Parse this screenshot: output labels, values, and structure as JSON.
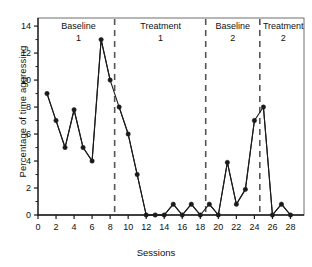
{
  "chart_data": {
    "type": "line",
    "title": "",
    "xlabel": "Sessions",
    "ylabel": "Percentage of time aggressing",
    "xlim": [
      0,
      29.5
    ],
    "ylim": [
      0,
      14.6
    ],
    "xticks": [
      0,
      2,
      4,
      6,
      8,
      10,
      12,
      14,
      16,
      18,
      20,
      22,
      24,
      26,
      28
    ],
    "xtick_labels": [
      "0",
      "2",
      "4",
      "6",
      "8",
      "10",
      "12",
      "14",
      "16",
      "18",
      "20",
      "22",
      "24",
      "26",
      "28"
    ],
    "yticks": [
      0,
      2,
      4,
      6,
      8,
      10,
      12,
      14
    ],
    "ytick_labels": [
      "0",
      "2",
      "4",
      "6",
      "8",
      "10",
      "12",
      "14"
    ],
    "grid": false,
    "legend": "none",
    "marker": "filled-circle",
    "line_color": "#1a1a1a",
    "phase_dividers": [
      8.5,
      18.6,
      24.6
    ],
    "phases": [
      {
        "name": "Baseline",
        "number": "1",
        "x_center": 4.5
      },
      {
        "name": "Treatment",
        "number": "1",
        "x_center": 13.6
      },
      {
        "name": "Baseline",
        "number": "2",
        "x_center": 21.6
      },
      {
        "name": "Treatment",
        "number": "2",
        "x_center": 27.2
      }
    ],
    "series": [
      {
        "name": "Baseline 1",
        "x": [
          1,
          2,
          3,
          4,
          5,
          6,
          7,
          8
        ],
        "values": [
          9,
          7,
          5,
          7.8,
          5,
          4,
          13,
          10
        ]
      },
      {
        "name": "Treatment 1",
        "x": [
          9,
          10,
          11,
          12,
          13,
          14,
          15,
          16,
          17,
          18
        ],
        "values": [
          8,
          6,
          3,
          0,
          0,
          0,
          0.8,
          0,
          0.8,
          0
        ]
      },
      {
        "name": "Baseline 2",
        "x": [
          19,
          20,
          21,
          22,
          23,
          24
        ],
        "values": [
          0.8,
          0,
          3.9,
          0.8,
          1.9,
          7
        ]
      },
      {
        "name": "Treatment 2",
        "x": [
          25,
          26,
          27,
          28
        ],
        "values": [
          8,
          0,
          0.8,
          0
        ]
      }
    ]
  }
}
